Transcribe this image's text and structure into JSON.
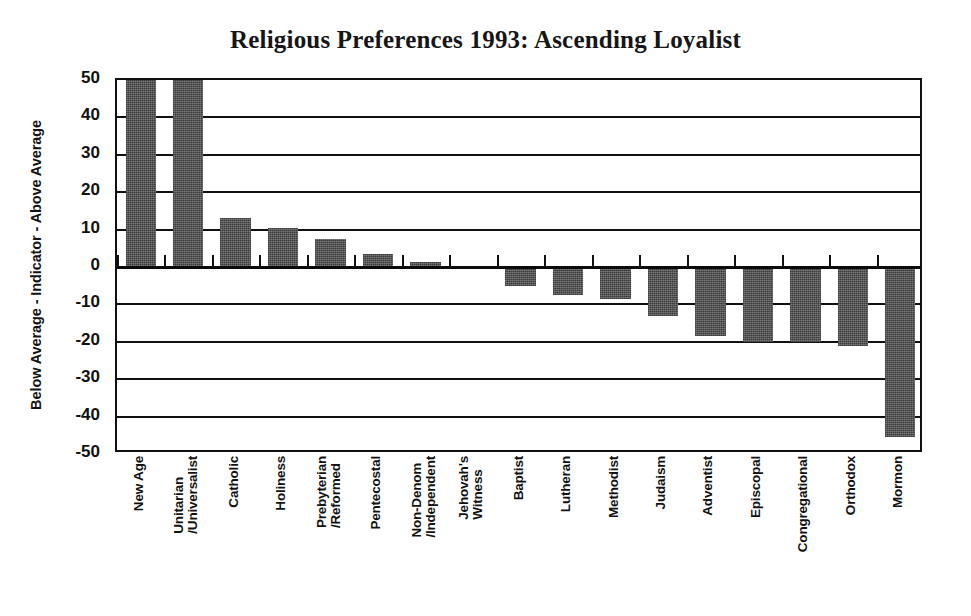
{
  "chart_data": {
    "type": "bar",
    "title": "Religious Preferences 1993: Ascending Loyalist",
    "xlabel": "",
    "ylabel": "Below Average - Indicator - Above Average",
    "ylim": [
      -50,
      50
    ],
    "ytick_labels": [
      "50",
      "40",
      "30",
      "20",
      "10",
      "0",
      "-10",
      "-20",
      "-30",
      "-40",
      "-50"
    ],
    "yticks": [
      50,
      40,
      30,
      20,
      10,
      0,
      -10,
      -20,
      -30,
      -40,
      -50
    ],
    "grid": true,
    "legend": "none",
    "bar_color": "#5b5b5b",
    "axis_color": "#111111",
    "note": "First two bars are clipped at the top of the plot frame (values exceed the 50 axis maximum).",
    "categories": [
      "New Age",
      "Unitarian\n/Universalist",
      "Catholic",
      "Holiness",
      "Prebyterian\n/Reformed",
      "Pentecostal",
      "Non-Denom\n/Independent",
      "Jehovah's\nWitness",
      "Baptist",
      "Lutheran",
      "Methodist",
      "Judaism",
      "Adventist",
      "Episcopal",
      "Congregational",
      "Orthodox",
      "Mormon"
    ],
    "values": [
      50,
      50,
      13,
      10.5,
      7.5,
      3.5,
      1.3,
      0,
      -5,
      -7.5,
      -8.5,
      -13,
      -18.5,
      -20,
      -20,
      -21,
      -45.5
    ],
    "clipped": [
      true,
      true,
      false,
      false,
      false,
      false,
      false,
      false,
      false,
      false,
      false,
      false,
      false,
      false,
      false,
      false,
      false
    ]
  }
}
